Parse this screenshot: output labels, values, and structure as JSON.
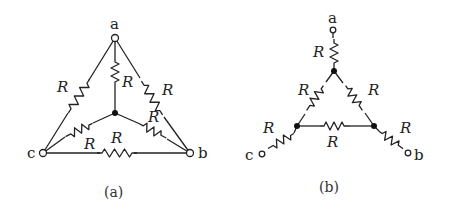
{
  "figures": [
    {
      "id": "a",
      "caption": "(a)",
      "terminals": {
        "a": "a",
        "b": "b",
        "c": "c"
      },
      "resistor_label": "R",
      "resistor_count": 6,
      "description": "Delta of three resistors R between a, b, c with a star of three resistors R from a central node to a, b, c"
    },
    {
      "id": "b",
      "caption": "(b)",
      "terminals": {
        "a": "a",
        "b": "b",
        "c": "c"
      },
      "resistor_label": "R",
      "resistor_count": 6,
      "description": "Inner delta triangle of three resistors R, each corner connected to terminal a, b, c through a resistor R"
    }
  ]
}
